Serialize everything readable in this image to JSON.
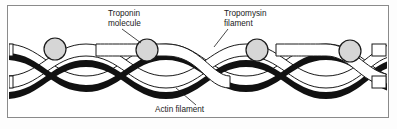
{
  "figure": {
    "frame_color": "#8a8a8a",
    "background_color": "#ffffff",
    "labels": [
      {
        "id": "troponin",
        "line1": "Troponin",
        "line2": "molecule",
        "x": 108,
        "y": 16,
        "leader": "M 122 29 L 141 43"
      },
      {
        "id": "tropomyosin",
        "line1": "Tropomysin",
        "line2": "filament",
        "x": 224,
        "y": 16,
        "leader": "M 228 29 L 214 47"
      },
      {
        "id": "actin",
        "line1": "Actin filament",
        "line2": "",
        "x": 155,
        "y": 112,
        "leader": "M 196 105 L 176 88"
      }
    ],
    "troponin_molecules": [
      {
        "cx": 55,
        "cy": 49,
        "r": 11
      },
      {
        "cx": 147,
        "cy": 50,
        "r": 11
      },
      {
        "cx": 257,
        "cy": 50,
        "r": 11
      },
      {
        "cx": 350,
        "cy": 51,
        "r": 11
      }
    ],
    "colors": {
      "troponin_fill": "#d6d6d6",
      "troponin_stroke": "#1a1a1a",
      "actin_fill": "#ffffff",
      "actin_stroke": "#1a1a1a",
      "tropomyosin_fill": "#111111",
      "label_text": "#1a1a1a"
    },
    "structure": {
      "actin_strands": 2,
      "tropomyosin_strands": 2,
      "troponin_count": 4,
      "helix_turns": 3
    }
  }
}
